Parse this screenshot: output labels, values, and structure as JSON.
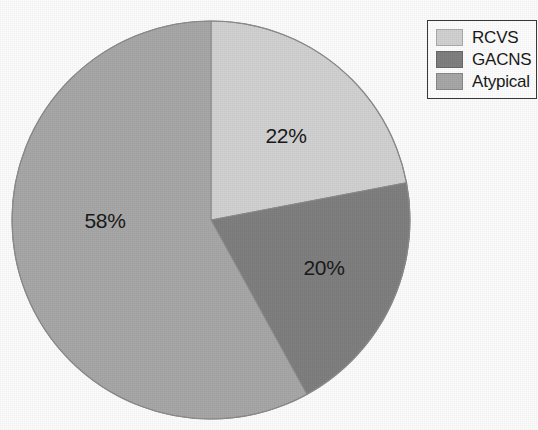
{
  "chart_data": {
    "type": "pie",
    "title": "",
    "subtitle": "",
    "xlabel": "",
    "ylabel": "",
    "categories": [
      "RCVS",
      "GACNS",
      "Atypical"
    ],
    "values": [
      22,
      20,
      58
    ],
    "value_unit": "%",
    "data_labels": [
      "22%",
      "20%",
      "58%"
    ],
    "colors": [
      "#d2d2d2",
      "#808080",
      "#a8a8a8"
    ],
    "start_angle_deg": 0,
    "direction": "clockwise",
    "legend": {
      "position": "top-right",
      "entries": [
        {
          "label": "RCVS",
          "color": "#d2d2d2",
          "value": 22
        },
        {
          "label": "GACNS",
          "color": "#808080",
          "value": 20
        },
        {
          "label": "Atypical",
          "color": "#a8a8a8",
          "value": 58
        }
      ]
    },
    "grid": false,
    "slices": [
      {
        "name": "RCVS",
        "value": 22,
        "label": "22%",
        "color": "#d2d2d2",
        "start_deg": 0,
        "end_deg": 79.2
      },
      {
        "name": "GACNS",
        "value": 20,
        "label": "20%",
        "color": "#808080",
        "start_deg": 79.2,
        "end_deg": 151.2
      },
      {
        "name": "Atypical",
        "value": 58,
        "label": "58%",
        "color": "#a8a8a8",
        "start_deg": 151.2,
        "end_deg": 360
      }
    ]
  },
  "figure": {
    "background": "#fdfdfd",
    "outline_color": "#8c8c8c",
    "label_color": "#1a1a1a"
  },
  "geometry": {
    "cx": 211,
    "cy": 220,
    "r": 199,
    "label_positions": [
      {
        "label": "22%",
        "x": 286,
        "y": 136
      },
      {
        "label": "20%",
        "x": 324,
        "y": 268
      },
      {
        "label": "58%",
        "x": 105,
        "y": 221
      }
    ]
  }
}
